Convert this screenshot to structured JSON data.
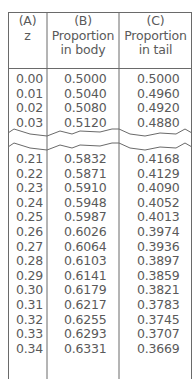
{
  "table": {
    "headers": [
      {
        "label": "(A)",
        "sub1": "z",
        "sub2": ""
      },
      {
        "label": "(B)",
        "sub1": "Proportion",
        "sub2": "in body"
      },
      {
        "label": "(C)",
        "sub1": "Proportion",
        "sub2": "in tail"
      }
    ],
    "rows_top": [
      {
        "z": "0.00",
        "body": "0.5000",
        "tail": "0.5000"
      },
      {
        "z": "0.01",
        "body": "0.5040",
        "tail": "0.4960"
      },
      {
        "z": "0.02",
        "body": "0.5080",
        "tail": "0.4920"
      },
      {
        "z": "0.03",
        "body": "0.5120",
        "tail": "0.4880"
      }
    ],
    "rows_bottom": [
      {
        "z": "0.21",
        "body": "0.5832",
        "tail": "0.4168"
      },
      {
        "z": "0.22",
        "body": "0.5871",
        "tail": "0.4129"
      },
      {
        "z": "0.23",
        "body": "0.5910",
        "tail": "0.4090"
      },
      {
        "z": "0.24",
        "body": "0.5948",
        "tail": "0.4052"
      },
      {
        "z": "0.25",
        "body": "0.5987",
        "tail": "0.4013"
      },
      {
        "z": "0.26",
        "body": "0.6026",
        "tail": "0.3974"
      },
      {
        "z": "0.27",
        "body": "0.6064",
        "tail": "0.3936"
      },
      {
        "z": "0.28",
        "body": "0.6103",
        "tail": "0.3897"
      },
      {
        "z": "0.29",
        "body": "0.6141",
        "tail": "0.3859"
      },
      {
        "z": "0.30",
        "body": "0.6179",
        "tail": "0.3821"
      },
      {
        "z": "0.31",
        "body": "0.6217",
        "tail": "0.3783"
      },
      {
        "z": "0.32",
        "body": "0.6255",
        "tail": "0.3745"
      },
      {
        "z": "0.33",
        "body": "0.6293",
        "tail": "0.3707"
      },
      {
        "z": "0.34",
        "body": "0.6331",
        "tail": "0.3669"
      }
    ]
  },
  "colors": {
    "line": "#666666",
    "text": "#5a5a5a",
    "background": "#ffffff"
  }
}
